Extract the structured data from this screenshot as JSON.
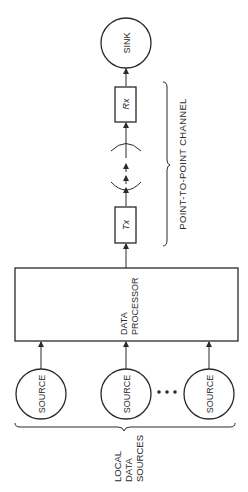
{
  "diagram": {
    "orientation": "rotated-90-ccw",
    "nodes": {
      "sink": {
        "label": "SINK"
      },
      "rx": {
        "label": "Rx"
      },
      "tx": {
        "label": "Tx"
      },
      "processor": {
        "line1": "DATA",
        "line2": "PROCESSOR"
      },
      "sources": [
        {
          "label": "SOURCE"
        },
        {
          "label": "SOURCE"
        },
        {
          "label": "SOURCE"
        }
      ],
      "ellipsis": "• • •"
    },
    "groups": {
      "channel": {
        "label": "POINT-TO-POINT CHANNEL"
      },
      "local_sources": {
        "line1": "LOCAL",
        "line2": "DATA",
        "line3": "SOURCES"
      }
    },
    "colors": {
      "stroke": "#2a2a2a",
      "background": "#ffffff"
    }
  }
}
